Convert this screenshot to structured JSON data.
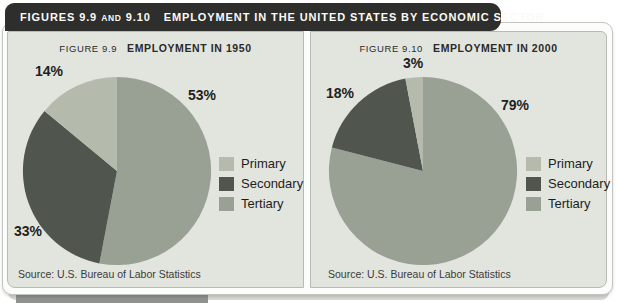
{
  "header": {
    "part1": "FIGURES 9.9",
    "and": "AND",
    "part2": "9.10",
    "title": "EMPLOYMENT IN THE UNITED STATES BY ECONOMIC SECTOR"
  },
  "panels": [
    {
      "figure_label": "FIGURE 9.9",
      "title": "EMPLOYMENT IN 1950",
      "labels": {
        "primary": "14%",
        "secondary": "33%",
        "tertiary": "53%"
      },
      "source": "Source: U.S. Bureau of Labor Statistics"
    },
    {
      "figure_label": "FIGURE 9.10",
      "title": "EMPLOYMENT IN 2000",
      "labels": {
        "primary": "3%",
        "secondary": "18%",
        "tertiary": "79%"
      },
      "source": "Source: U.S. Bureau of Labor Statistics"
    }
  ],
  "legend": {
    "items": [
      {
        "label": "Primary"
      },
      {
        "label": "Secondary"
      },
      {
        "label": "Tertiary"
      }
    ]
  },
  "colors": {
    "header_bg": "#2e2e2c",
    "header_text": "#fafaf7",
    "panel_bg": "#e2e5de",
    "page_bg": "#fcfdfb",
    "primary": "#b4baac",
    "secondary": "#50564e",
    "tertiary": "#99a094"
  },
  "chart_data": [
    {
      "type": "pie",
      "title": "Figure 9.9 Employment in 1950",
      "categories": [
        "Primary",
        "Secondary",
        "Tertiary"
      ],
      "values": [
        14,
        33,
        53
      ],
      "unit": "%",
      "legend_position": "right",
      "start_angle_deg_from_top": 0,
      "direction": "clockwise",
      "slice_order_clockwise_from_top": [
        "Tertiary",
        "Secondary",
        "Primary"
      ],
      "colors": {
        "Primary": "#b4baac",
        "Secondary": "#50564e",
        "Tertiary": "#99a094"
      }
    },
    {
      "type": "pie",
      "title": "Figure 9.10 Employment in 2000",
      "categories": [
        "Primary",
        "Secondary",
        "Tertiary"
      ],
      "values": [
        3,
        18,
        79
      ],
      "unit": "%",
      "legend_position": "right",
      "start_angle_deg_from_top": 0,
      "direction": "clockwise",
      "slice_order_clockwise_from_top": [
        "Tertiary",
        "Secondary",
        "Primary"
      ],
      "colors": {
        "Primary": "#b4baac",
        "Secondary": "#50564e",
        "Tertiary": "#99a094"
      }
    }
  ]
}
